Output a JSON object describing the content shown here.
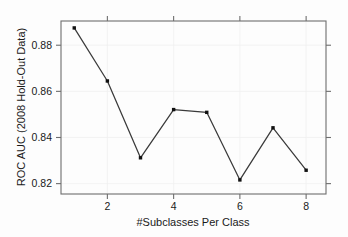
{
  "chart_data": {
    "type": "line",
    "title": "",
    "subtitle": "",
    "xlabel": "#Subclasses Per Class",
    "ylabel": "ROC AUC (2008 Hold-Out Data)",
    "x": [
      1,
      2,
      3,
      4,
      5,
      6,
      7,
      8
    ],
    "values": [
      0.8875,
      0.8645,
      0.8312,
      0.8521,
      0.8509,
      0.8216,
      0.8442,
      0.8258
    ],
    "series": [
      {
        "name": "ROC AUC",
        "values": [
          0.8875,
          0.8645,
          0.8312,
          0.8521,
          0.8509,
          0.8216,
          0.8442,
          0.8258
        ]
      }
    ],
    "xlim": [
      0.6,
      8.6
    ],
    "ylim": [
      0.8155,
      0.8905
    ],
    "xticks": [
      2,
      4,
      6,
      8
    ],
    "xtick_labels": [
      "2",
      "4",
      "6",
      "8"
    ],
    "yticks": [
      0.82,
      0.84,
      0.86,
      0.88
    ],
    "ytick_labels": [
      "0.82",
      "0.84",
      "0.86",
      "0.88"
    ],
    "grid": false,
    "legend": null,
    "legend_position": "none",
    "marker": "filled-square",
    "line_color": "#3a3a3a",
    "marker_color": "#111111",
    "axis_color": "#6e6e6e",
    "background_color": "#fdfdfd"
  }
}
